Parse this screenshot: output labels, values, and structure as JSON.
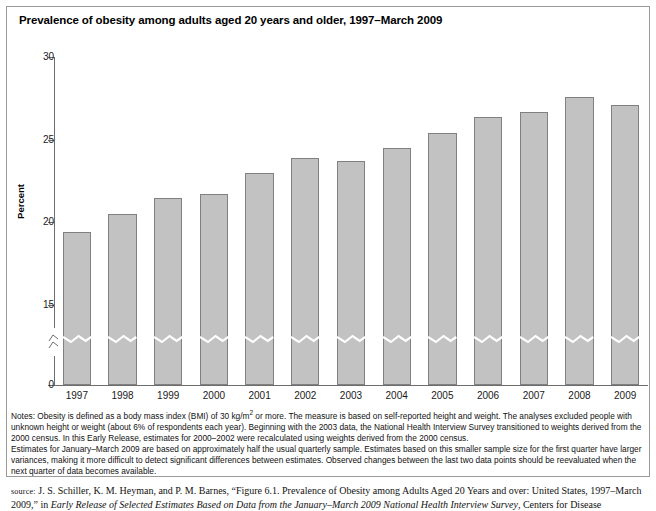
{
  "title": "Prevalence of obesity among adults aged 20 years and older, 1997–March 2009",
  "chart_data": {
    "type": "bar",
    "title": "Prevalence of obesity among adults aged 20 years and older, 1997–March 2009",
    "xlabel": "",
    "ylabel": "Percent",
    "categories": [
      "1997",
      "1998",
      "1999",
      "2000",
      "2001",
      "2002",
      "2003",
      "2004",
      "2005",
      "2006",
      "2007",
      "2008",
      "2009"
    ],
    "values": [
      19.4,
      20.5,
      21.5,
      21.7,
      23.0,
      23.9,
      23.7,
      24.5,
      25.4,
      26.4,
      26.7,
      27.6,
      27.1
    ],
    "ylim": [
      0,
      30
    ],
    "yticks": [
      0,
      15,
      20,
      25,
      30
    ],
    "ytick_labels": [
      "0",
      "15",
      "20",
      "25",
      "30"
    ],
    "axis_break": true,
    "axis_break_between": [
      0,
      15
    ],
    "grid": false,
    "legend": "none",
    "bar_color": "#c2c2c2",
    "bar_border_color": "#808080",
    "axis_color": "#6d6d6d"
  },
  "notes": {
    "line1": "Notes: Obesity is defined as a body mass index (BMI) of 30 kg/m",
    "line1_sup": "2",
    "line1b": " or more. The measure is based on self-reported height and weight. The analyses excluded people with unknown height or weight (about 6% of respondents each year). Beginning with the 2003 data, the National Health Interview Survey transitioned to weights derived from the 2000 census. In this Early Release, estimates for 2000–2002 were recalculated using weights derived from the 2000 census.",
    "line2": "Estimates for January–March 2009 are based on approximately half the usual quarterly sample. Estimates based on this smaller sample size for the first quarter have larger variances, making it more difficult to detect significant differences between estimates. Observed changes between the last two data points should be reevaluated when the next quarter of data becomes available."
  },
  "source": {
    "label": "source:",
    "text_a": " J. S. Schiller, K. M. Heyman, and P. M. Barnes, “Figure 6.1. Prevalence of Obesity among Adults Aged 20 Years and over: United States, 1997–March 2009,” in ",
    "text_italic": "Early Release of Selected Estimates Based on Data from the January–March 2009 National Health Interview Survey",
    "text_b": ", Centers for Disease"
  }
}
